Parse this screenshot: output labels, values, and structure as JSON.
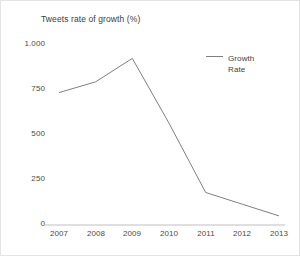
{
  "chart_data": {
    "type": "line",
    "title": "Tweets rate of growth (%)",
    "xlabel": "",
    "ylabel": "",
    "categories": [
      "2007",
      "2008",
      "2009",
      "2010",
      "2011",
      "2012",
      "2013"
    ],
    "values": [
      730,
      790,
      920,
      560,
      175,
      110,
      45
    ],
    "series": [
      {
        "name": "Growth Rate",
        "values": [
          730,
          790,
          920,
          560,
          175,
          110,
          45
        ],
        "color": "#7f7f7f"
      }
    ],
    "ytick_labels": [
      "1.000",
      "750",
      "500",
      "250",
      "0"
    ],
    "ytick_values": [
      1000,
      750,
      500,
      250,
      0
    ],
    "xtick_labels": [
      "2007",
      "2008",
      "2009",
      "2010",
      "2011",
      "2012",
      "2013"
    ],
    "ylim": [
      0,
      1000
    ],
    "grid": false,
    "legend_position": "right",
    "legend_entries": [
      "Growth Rate"
    ]
  },
  "legend": {
    "label": "Growth Rate",
    "swatch_icon": "line-swatch-icon"
  },
  "axes": {
    "line_color": "#bfbfbf",
    "tick_text_color": "#4a4a4a"
  }
}
